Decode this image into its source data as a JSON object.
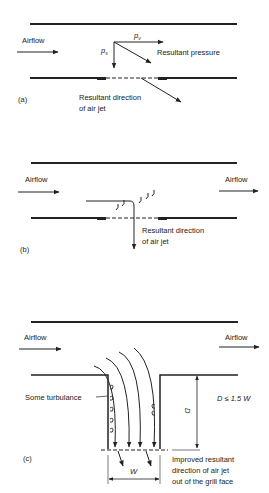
{
  "panels": {
    "a": {
      "tag": "(a)",
      "airflow": "Airflow",
      "pv": "p",
      "pv_sub": "v",
      "ps": "p",
      "ps_sub": "s",
      "resultant_pressure": "Resultant pressure",
      "jet_line1": "Resultant direction",
      "jet_line2": "of air jet"
    },
    "b": {
      "tag": "(b)",
      "airflow_left": "Airflow",
      "airflow_right": "Airflow",
      "jet_line1": "Resultant direction",
      "jet_line2": "of air jet"
    },
    "c": {
      "tag": "(c)",
      "airflow_left": "Airflow",
      "airflow_right": "Airflow",
      "turbulence": "Some turbulance",
      "d_label": "D",
      "condition": "D ≤ 1.5 W",
      "w_label": "W",
      "jet_line1": "Improved resultant",
      "jet_line2": "direction of air jet",
      "jet_line3": "out of the grill face"
    }
  },
  "colors": {
    "ink": "#222222",
    "background": "#ffffff"
  }
}
